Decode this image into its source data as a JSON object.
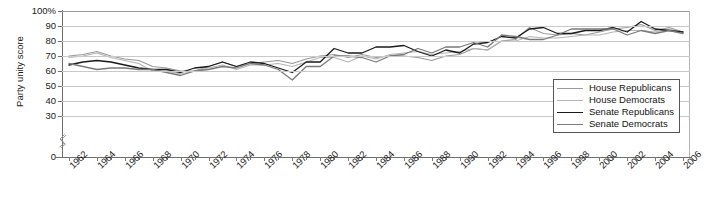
{
  "chart_data": {
    "type": "line",
    "title": "",
    "xlabel": "",
    "ylabel": "Party unity score",
    "xlim": [
      1962,
      2006
    ],
    "ylim": [
      30,
      100
    ],
    "y_axis_break": true,
    "grid": true,
    "legend_position": "inside-bottom-right",
    "ytick_labels": [
      "100%",
      "90",
      "80",
      "70",
      "60",
      "50",
      "40",
      "30",
      "0"
    ],
    "ytick_values": [
      100,
      90,
      80,
      70,
      60,
      50,
      40,
      30,
      0
    ],
    "xtick_labels": [
      "1962",
      "1964",
      "1966",
      "1968",
      "1970",
      "1972",
      "1974",
      "1976",
      "1978",
      "1980",
      "1982",
      "1984",
      "1986",
      "1988",
      "1990",
      "1992",
      "1994",
      "1996",
      "1998",
      "2000",
      "2002",
      "2004",
      "2006"
    ],
    "x": [
      1962,
      1963,
      1964,
      1965,
      1966,
      1967,
      1968,
      1969,
      1970,
      1971,
      1972,
      1973,
      1974,
      1975,
      1976,
      1977,
      1978,
      1979,
      1980,
      1981,
      1982,
      1983,
      1984,
      1985,
      1986,
      1987,
      1988,
      1989,
      1990,
      1991,
      1992,
      1993,
      1994,
      1995,
      1996,
      1997,
      1998,
      1999,
      2000,
      2001,
      2002,
      2003,
      2004,
      2005,
      2006
    ],
    "series": [
      {
        "name": "House Republicans",
        "color": "#9a9a9a",
        "width": 1.2,
        "values": [
          70,
          71,
          73,
          70,
          68,
          67,
          63,
          62,
          60,
          60,
          63,
          66,
          63,
          65,
          66,
          67,
          65,
          68,
          70,
          71,
          69,
          71,
          69,
          70,
          70,
          69,
          67,
          70,
          71,
          75,
          74,
          80,
          81,
          89,
          85,
          84,
          85,
          84,
          86,
          88,
          89,
          91,
          87,
          89,
          86
        ]
      },
      {
        "name": "House Democrats",
        "color": "#b5b5b5",
        "width": 1.2,
        "values": [
          69,
          70,
          72,
          69,
          67,
          65,
          60,
          60,
          58,
          60,
          62,
          64,
          61,
          64,
          64,
          65,
          63,
          66,
          69,
          69,
          66,
          70,
          68,
          71,
          72,
          73,
          71,
          72,
          73,
          75,
          74,
          80,
          80,
          83,
          82,
          82,
          83,
          84,
          84,
          86,
          87,
          87,
          86,
          88,
          86
        ]
      },
      {
        "name": "Senate Republicans",
        "color": "#1a1a1a",
        "width": 1.3,
        "values": [
          64,
          66,
          67,
          66,
          64,
          62,
          61,
          61,
          59,
          62,
          63,
          66,
          63,
          66,
          65,
          62,
          59,
          66,
          66,
          75,
          72,
          72,
          76,
          76,
          77,
          73,
          70,
          74,
          72,
          78,
          79,
          83,
          82,
          88,
          89,
          85,
          85,
          87,
          87,
          89,
          86,
          93,
          88,
          87,
          86
        ]
      },
      {
        "name": "Senate Democrats",
        "color": "#7a7a7a",
        "width": 1.3,
        "values": [
          65,
          63,
          61,
          62,
          62,
          61,
          61,
          59,
          57,
          60,
          61,
          63,
          62,
          65,
          64,
          61,
          54,
          63,
          63,
          70,
          70,
          69,
          66,
          70,
          71,
          75,
          72,
          76,
          76,
          79,
          76,
          84,
          83,
          81,
          81,
          84,
          88,
          88,
          88,
          88,
          84,
          87,
          85,
          87,
          85
        ]
      }
    ]
  },
  "legend": {
    "items": [
      {
        "label": "House Republicans"
      },
      {
        "label": "House Democrats"
      },
      {
        "label": "Senate Republicans"
      },
      {
        "label": "Senate Democrats"
      }
    ]
  }
}
